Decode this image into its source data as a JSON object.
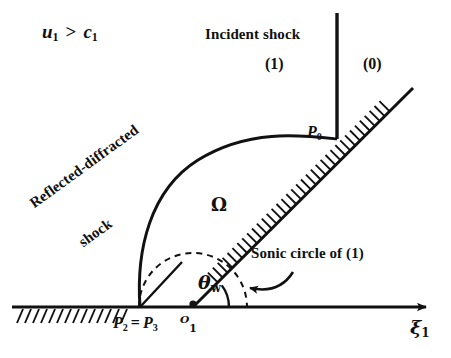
{
  "figure": {
    "name": "regular-reflection-shock-diagram",
    "background_color": "#ffffff",
    "line_color": "#111111",
    "width": 451,
    "height": 358
  },
  "labels": {
    "flow_condition": {
      "base": "u",
      "sub1": "1",
      "operator": ">",
      "base2": "c",
      "sub2": "1",
      "full": "u1 > c1"
    },
    "incident_shock": "Incident shock",
    "state_one": "(1)",
    "state_zero": "(0)",
    "triple_point": {
      "base": "P",
      "sub": "0",
      "full": "P0"
    },
    "reflected_shock_line1": "Reflected-diffracted",
    "reflected_shock_line2": "shock",
    "domain": "Ω",
    "sonic_circle": "Sonic circle of (1)",
    "wedge_angle": {
      "base": "θ",
      "sub": "w",
      "full": "θw"
    },
    "points_p2_p3": {
      "p2": "P",
      "p2sub": "2",
      "equals": "=",
      "p3": "P",
      "p3sub": "3",
      "full": "P2 = P3"
    },
    "origin": {
      "base": "ᴼ",
      "sub": "1",
      "full": "O1"
    },
    "axis_xi": {
      "base": "ξ",
      "sub": "1",
      "full": "ξ1"
    }
  },
  "geometry": {
    "origin_O1": [
      193,
      307
    ],
    "point_P2_P3": [
      141,
      307
    ],
    "point_P0": [
      337,
      138
    ],
    "incident_shock_top": [
      337,
      13
    ],
    "wedge_ramp_end": [
      413,
      88
    ],
    "axis_right_end": [
      432,
      307
    ],
    "axis_left_end": [
      12,
      307
    ],
    "sonic_circle_center": [
      193,
      307
    ],
    "sonic_circle_radius": 54,
    "wedge_angle_degrees": 37,
    "angle_arc_radius": 36
  }
}
